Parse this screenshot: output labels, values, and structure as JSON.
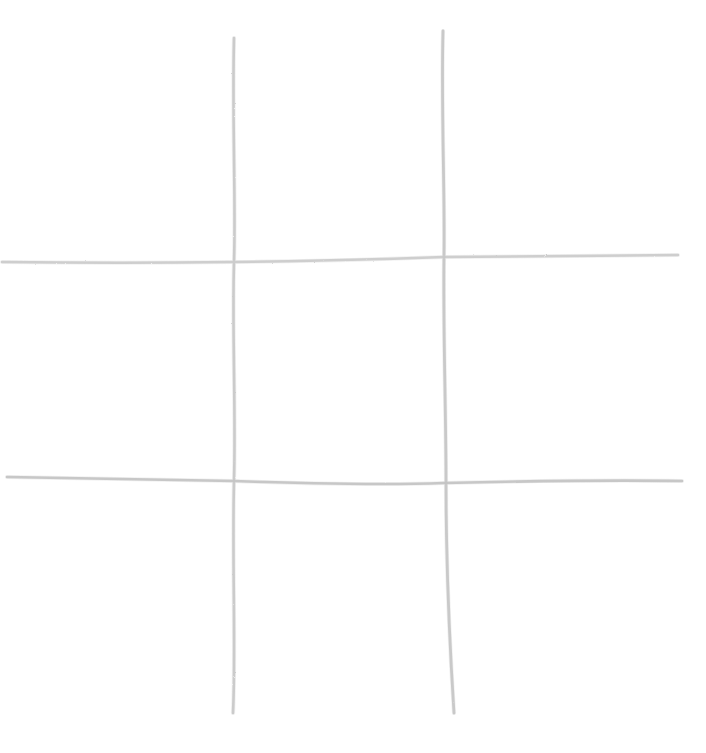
{
  "canvas": {
    "width": 706,
    "height": 753,
    "background_color": "#ffffff"
  },
  "board": {
    "name": "tic-tac-toe-grid",
    "style": "hand-drawn pencil sketch",
    "line_color": "#bfbfbf",
    "line_color_light": "#d2d2d2",
    "line_width": 2.4,
    "rows": 3,
    "columns": 3,
    "cells_filled": 0,
    "cells_empty": 9,
    "cell_marks": [
      [
        "",
        "",
        ""
      ],
      [
        "",
        "",
        ""
      ],
      [
        "",
        "",
        ""
      ]
    ],
    "lines": [
      {
        "name": "vertical-line-left",
        "orientation": "vertical",
        "color": "#c4c4c4",
        "width": 2.6,
        "path": "M 234 38 C 232 120, 236 200, 234 262 C 232 330, 236 410, 234 481 C 232 560, 236 650, 233 713"
      },
      {
        "name": "vertical-line-right",
        "orientation": "vertical",
        "color": "#c0c0c0",
        "width": 2.8,
        "path": "M 443 31 C 441 110, 445 190, 444 256 C 443 330, 446 410, 446 482 C 446 560, 450 650, 454 713"
      },
      {
        "name": "horizontal-line-top",
        "orientation": "horizontal",
        "color": "#c6c6c6",
        "width": 2.4,
        "path": "M 2 262 C 80 263, 160 263, 234 262 C 320 261, 390 259, 444 257 C 520 256, 600 256, 678 255"
      },
      {
        "name": "horizontal-line-bottom",
        "orientation": "horizontal",
        "color": "#bdbdbd",
        "width": 2.6,
        "path": "M 7 477 C 90 478, 170 480, 234 481 C 320 484, 390 485, 444 483 C 530 481, 610 480, 682 481"
      }
    ]
  },
  "cells": [
    {
      "name": "cell-top-left",
      "row": 0,
      "col": 0,
      "mark": ""
    },
    {
      "name": "cell-top-center",
      "row": 0,
      "col": 1,
      "mark": ""
    },
    {
      "name": "cell-top-right",
      "row": 0,
      "col": 2,
      "mark": ""
    },
    {
      "name": "cell-middle-left",
      "row": 1,
      "col": 0,
      "mark": ""
    },
    {
      "name": "cell-middle-center",
      "row": 1,
      "col": 1,
      "mark": ""
    },
    {
      "name": "cell-middle-right",
      "row": 1,
      "col": 2,
      "mark": ""
    },
    {
      "name": "cell-bottom-left",
      "row": 2,
      "col": 0,
      "mark": ""
    },
    {
      "name": "cell-bottom-center",
      "row": 2,
      "col": 1,
      "mark": ""
    },
    {
      "name": "cell-bottom-right",
      "row": 2,
      "col": 2,
      "mark": ""
    }
  ]
}
